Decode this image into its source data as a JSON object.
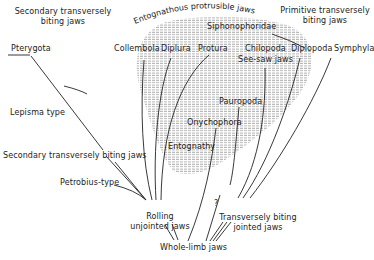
{
  "diagram": {
    "type": "evolutionary tree of arthropod jaw mechanisms",
    "colors": {
      "line": "#222222",
      "shade": "#9a9a9a",
      "background": "#ffffff"
    },
    "region": {
      "label": "Entognathous protrusible jaws",
      "inner_label": "Entognathy"
    },
    "labels": {
      "secondary_top": "Secondary transversely\nbiting jaws",
      "secondary_top_line1": "Secondary transversely",
      "secondary_top_line2": "biting jaws",
      "primitive_line1": "Primitive transversely",
      "primitive_line2": "biting jaws",
      "entognathous": "Entognathous protrusible jaws",
      "siphonophoridae": "Siphonophoridae",
      "collembola": "Collembola",
      "diplura": "Diplura",
      "protura": "Protura",
      "chilopoda": "Chilopoda",
      "see_saw": "See-saw jaws",
      "diplopoda": "Diplopoda",
      "symphyla": "Symphyla",
      "pterygota": "Pterygota",
      "lepisma": "Lepisma type",
      "secondary_mid": "Secondary transversely biting jaws",
      "petrobius": "Petrobius-type",
      "pauropoda": "Pauropoda",
      "onychophora": "Onychophora",
      "entognathy": "Entognathy",
      "question": "?",
      "rolling_line1": "Rolling",
      "rolling_line2": "unjointed jaws",
      "transverse_line1": "Transversely biting",
      "transverse_line2": "jointed jaws",
      "whole_limb": "Whole-limb jaws"
    }
  }
}
